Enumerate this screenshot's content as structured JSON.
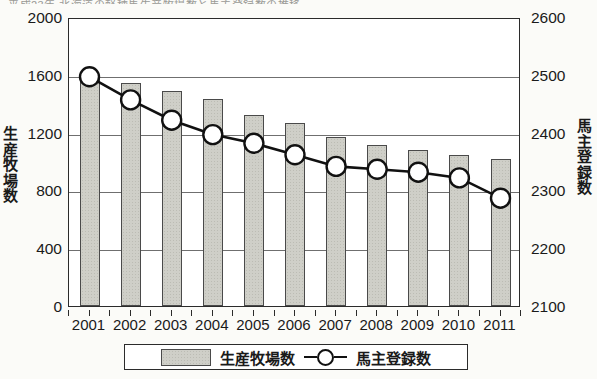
{
  "caption_sliver": "平成23年 北海道の軽種馬生産牧場数と馬主登録数の推移",
  "chart_data": {
    "type": "bar",
    "title": "",
    "categories": [
      "2001",
      "2002",
      "2003",
      "2004",
      "2005",
      "2006",
      "2007",
      "2008",
      "2009",
      "2010",
      "2011"
    ],
    "series": [
      {
        "name": "生産牧場数",
        "kind": "bar",
        "axis": "left",
        "values": [
          1590,
          1545,
          1490,
          1430,
          1320,
          1265,
          1170,
          1115,
          1080,
          1045,
          1020
        ]
      },
      {
        "name": "馬主登録数",
        "kind": "line",
        "axis": "right",
        "values": [
          2500,
          2460,
          2425,
          2400,
          2385,
          2365,
          2345,
          2340,
          2335,
          2325,
          2290
        ]
      }
    ],
    "xlabel": "",
    "ylabel_left": "生産牧場数",
    "ylabel_right": "馬主登録数",
    "ylim_left": [
      0,
      2000
    ],
    "ylim_right": [
      2100,
      2600
    ],
    "yticks_left": [
      "2000",
      "1600",
      "1200",
      "800",
      "400",
      "0"
    ],
    "yticks_right": [
      "2600",
      "2500",
      "2400",
      "2300",
      "2200",
      "2100"
    ],
    "ytick_values_left": [
      2000,
      1600,
      1200,
      800,
      400,
      0
    ],
    "ytick_values_right": [
      2600,
      2500,
      2400,
      2300,
      2200,
      2100
    ],
    "grid": true,
    "legend_position": "bottom"
  },
  "axis": {
    "left_title_chars": [
      "生",
      "産",
      "牧",
      "場",
      "数"
    ],
    "right_title_chars": [
      "馬",
      "主",
      "登",
      "録",
      "数"
    ]
  },
  "legend": {
    "bar_label": "生産牧場数",
    "line_label": "馬主登録数"
  },
  "colors": {
    "bar_fill": "#cfcfc8",
    "bar_border": "#4a4a4a",
    "line": "#111111",
    "marker_fill": "#ffffff",
    "frame": "#2b2b2b",
    "grid": "#6f6f6f",
    "background": "#fbfbf8"
  }
}
